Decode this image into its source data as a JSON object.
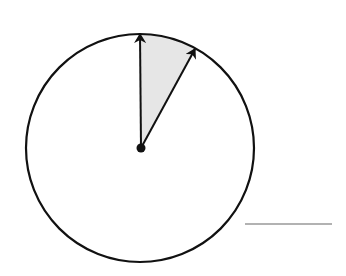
{
  "diagram": {
    "type": "circle-sector",
    "circle": {
      "cx": 140,
      "cy": 148,
      "r": 114,
      "stroke": "#111111",
      "stroke_width": 2.2
    },
    "center_dot": {
      "cx": 141,
      "cy": 148,
      "r": 4.5,
      "fill": "#111111"
    },
    "arrows": [
      {
        "name": "vertical-radius-arrow",
        "x1": 141,
        "y1": 148,
        "x2": 140,
        "y2": 34
      },
      {
        "name": "angled-radius-arrow",
        "x1": 141,
        "y1": 148,
        "x2": 195,
        "y2": 49
      }
    ],
    "sector": {
      "fill": "#e6e6e6",
      "start_angle_deg_from_vertical": 0,
      "end_angle_deg_from_vertical": 29
    },
    "answer_line": {
      "x1": 245,
      "y1": 224,
      "x2": 332,
      "y2": 224,
      "stroke": "#999999",
      "stroke_width": 1.5
    }
  }
}
